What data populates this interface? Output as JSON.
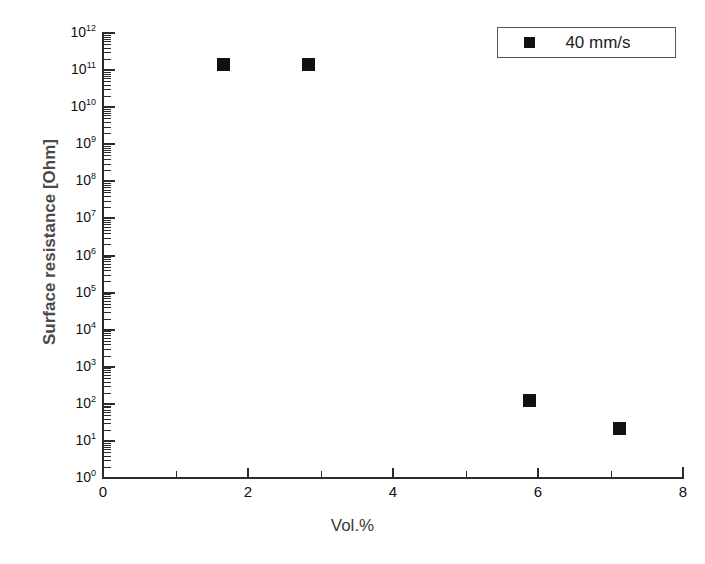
{
  "chart_data": {
    "type": "scatter",
    "title": "",
    "xlabel": "Vol.%",
    "ylabel": "Surface resistance  [Ohm]",
    "xlim": [
      0,
      8
    ],
    "ylim": [
      1,
      1000000000000
    ],
    "yscale": "log",
    "xscale": "linear",
    "grid": false,
    "legend_position": "top-right",
    "series": [
      {
        "name": "40 mm/s",
        "marker": "filled-square",
        "color": "#111111",
        "points": [
          {
            "x": 1.65,
            "y": 150000000000
          },
          {
            "x": 2.83,
            "y": 150000000000
          },
          {
            "x": 5.87,
            "y": 130
          },
          {
            "x": 7.12,
            "y": 23
          }
        ]
      }
    ],
    "x_ticks_major": [
      0,
      2,
      4,
      6,
      8
    ],
    "x_ticks_major_labels": [
      "0",
      "2",
      "4",
      "6",
      "8"
    ],
    "x_ticks_minor": [
      1,
      3,
      5,
      7
    ],
    "y_ticks_major_exponents": [
      0,
      1,
      2,
      3,
      4,
      5,
      6,
      7,
      8,
      9,
      10,
      11,
      12
    ],
    "y_tick_labels": [
      "10⁰",
      "10¹",
      "10²",
      "10³",
      "10⁴",
      "10⁵",
      "10⁶",
      "10⁷",
      "10⁸",
      "10⁹",
      "10¹⁰",
      "10¹¹",
      "10¹²"
    ],
    "y_tick_mantissa": [
      "10",
      "10",
      "10",
      "10",
      "10",
      "10",
      "10",
      "10",
      "10",
      "10",
      "10",
      "10",
      "10"
    ],
    "y_tick_exponent": [
      "0",
      "1",
      "2",
      "3",
      "4",
      "5",
      "6",
      "7",
      "8",
      "9",
      "10",
      "11",
      "12"
    ]
  },
  "legend": {
    "entries": [
      {
        "label": "40 mm/s",
        "marker_name": "square-marker"
      }
    ]
  },
  "axes": {
    "x_title": "Vol.%",
    "y_title": "Surface resistance  [Ohm]"
  },
  "colors": {
    "marker": "#111111",
    "axis": "#2b2b2b",
    "background": "#ffffff",
    "y_title": "#4a4a4a",
    "x_title": "#3a3a3a"
  }
}
